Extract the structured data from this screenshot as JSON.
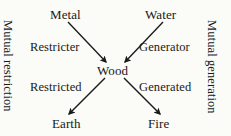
{
  "diagram": {
    "background_color": "#fbfbf7",
    "text_color": "#191919",
    "stroke_color": "#1a1a1a",
    "center_node": "Wood",
    "nodes": [
      {
        "id": "metal",
        "label": "Metal",
        "x": 68,
        "y": 14
      },
      {
        "id": "water",
        "label": "Water",
        "x": 162,
        "y": 14
      },
      {
        "id": "wood",
        "label": "Wood",
        "x": 113,
        "y": 70
      },
      {
        "id": "earth",
        "label": "Earth",
        "x": 70,
        "y": 123
      },
      {
        "id": "fire",
        "label": "Fire",
        "x": 160,
        "y": 123
      }
    ],
    "edges": [
      {
        "id": "metal-wood",
        "from": "Metal",
        "to": "Wood",
        "label": "Restricter",
        "direction": "into-center",
        "x1": 68,
        "y1": 22,
        "x2": 106,
        "y2": 62
      },
      {
        "id": "water-wood",
        "from": "Water",
        "to": "Wood",
        "label": "Generator",
        "direction": "into-center",
        "x1": 163,
        "y1": 22,
        "x2": 124,
        "y2": 62
      },
      {
        "id": "wood-earth",
        "from": "Wood",
        "to": "Earth",
        "label": "Restricted",
        "direction": "out-of-center",
        "x1": 105,
        "y1": 78,
        "x2": 68,
        "y2": 115
      },
      {
        "id": "wood-fire",
        "from": "Wood",
        "to": "Fire",
        "label": "Generated",
        "direction": "out-of-center",
        "x1": 124,
        "y1": 78,
        "x2": 160,
        "y2": 115
      }
    ],
    "edge_labels": {
      "restricter": "Restricter",
      "generator": "Generator",
      "restricted": "Restricted",
      "generated": "Generated"
    },
    "side_labels": {
      "left": "Mutual restriction",
      "right": "Mutual generation"
    }
  }
}
